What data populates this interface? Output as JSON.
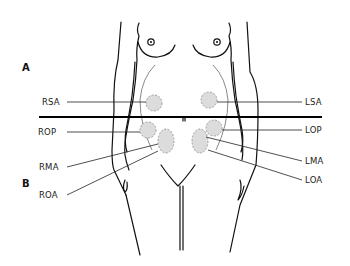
{
  "figure": {
    "section_labels": {
      "a": "A",
      "b": "B"
    },
    "positions": [
      {
        "id": "rsa",
        "label": "RSA",
        "side": "left"
      },
      {
        "id": "lsa",
        "label": "LSA",
        "side": "right"
      },
      {
        "id": "rop",
        "label": "ROP",
        "side": "left"
      },
      {
        "id": "lop",
        "label": "LOP",
        "side": "right"
      },
      {
        "id": "rma",
        "label": "RMA",
        "side": "left"
      },
      {
        "id": "lma",
        "label": "LMA",
        "side": "right"
      },
      {
        "id": "roa",
        "label": "ROA",
        "side": "left"
      },
      {
        "id": "loa",
        "label": "LOA",
        "side": "right"
      }
    ]
  },
  "colors": {
    "line": "#111111",
    "position_fill": "#dcdcdc",
    "position_outline": "#8a8a8a"
  }
}
